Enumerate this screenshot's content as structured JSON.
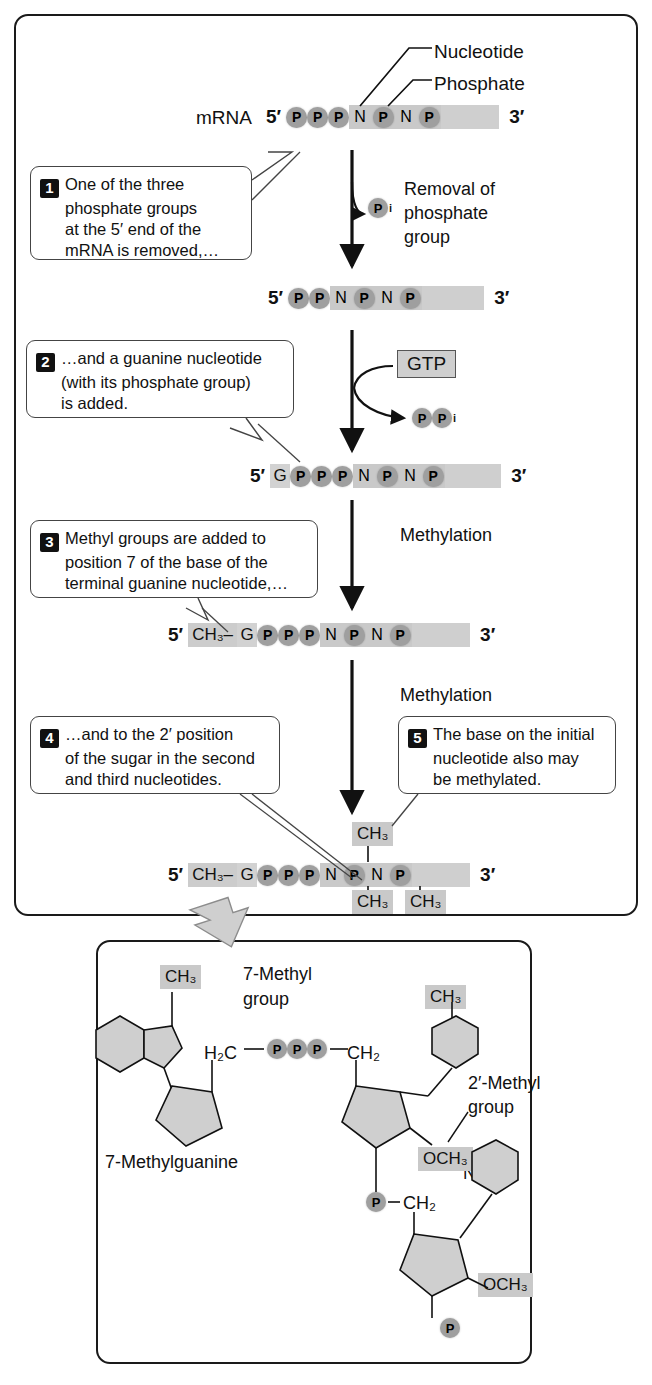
{
  "figure": {
    "labels": {
      "nucleotide": "Nucleotide",
      "phosphate": "Phosphate",
      "mrna": "mRNA",
      "five_prime": "5′",
      "three_prime": "3′"
    },
    "reactions": {
      "removal_line1": "Removal of",
      "removal_line2": "phosphate",
      "removal_line3": "group",
      "pi": "P",
      "pi_sub": "i",
      "gtp": "GTP",
      "ppi_p1": "P",
      "ppi_p2": "P",
      "ppi_sub": "i",
      "methylation_1": "Methylation",
      "methylation_2": "Methylation"
    },
    "steps": [
      {
        "number": "1",
        "lines": [
          "One of the three",
          "phosphate groups",
          "at the 5′ end of the",
          "mRNA is removed,…"
        ]
      },
      {
        "number": "2",
        "lines": [
          "…and a guanine nucleotide",
          "(with its phosphate group)",
          "is added."
        ]
      },
      {
        "number": "3",
        "lines": [
          "Methyl groups are added to",
          "position 7 of the base of the",
          "terminal guanine nucleotide,…"
        ]
      },
      {
        "number": "4",
        "lines": [
          "…and to the 2′ position",
          "of the sugar in the second",
          "and third nucleotides."
        ]
      },
      {
        "number": "5",
        "lines": [
          "The base on the initial",
          "nucleotide also may",
          "be methylated."
        ]
      }
    ],
    "strands": [
      {
        "name": "strand-initial",
        "prefix": "5′",
        "suffix": "3′",
        "units": [
          "P",
          "P",
          "P",
          "N",
          "P",
          "N",
          "P"
        ]
      },
      {
        "name": "strand-after-phosphate-removal",
        "prefix": "5′",
        "suffix": "3′",
        "units": [
          "P",
          "P",
          "N",
          "P",
          "N",
          "P"
        ]
      },
      {
        "name": "strand-after-guanine-added",
        "prefix": "5′",
        "suffix": "3′",
        "units": [
          "G",
          "P",
          "P",
          "P",
          "N",
          "P",
          "N",
          "P"
        ]
      },
      {
        "name": "strand-after-guanine-methylation",
        "prefix": "5′",
        "suffix": "3′",
        "cap": "CH₃–",
        "units": [
          "G",
          "P",
          "P",
          "P",
          "N",
          "P",
          "N",
          "P"
        ]
      },
      {
        "name": "strand-final-cap",
        "prefix": "5′",
        "suffix": "3′",
        "cap": "CH₃–",
        "units": [
          "G",
          "P",
          "P",
          "P",
          "N",
          "P",
          "N",
          "P"
        ],
        "methyl_top": "CH₃",
        "methyl_bottom_1": "CH₃",
        "methyl_bottom_2": "CH₃"
      }
    ],
    "structure": {
      "methyl_7": "CH₃",
      "methyl_7_label_line1": "7-Methyl",
      "methyl_7_label_line2": "group",
      "guanine_letter": "G",
      "guanine_name": "7-Methylguanine",
      "h2c": "H₂C",
      "phosphates": [
        "P",
        "P",
        "P"
      ],
      "ch2_right": "CH₂",
      "base_n_1": "N",
      "base_n_2": "N",
      "methyl_2prime": "CH₃",
      "methyl_2prime_label_line1": "2′-Methyl",
      "methyl_2prime_label_line2": "group",
      "och3_1": "OCH₃",
      "och3_2": "OCH₃",
      "phosphate_link_1": "P",
      "ch2_link": "CH₂",
      "phosphate_link_2": "P"
    },
    "colors": {
      "bead_gray": "#9f9f9f",
      "highlight_gray": "#c9c9c9",
      "strand_tail": "#cfcfcf",
      "outline": "#1a1a1a",
      "shape_fill": "#cccccc"
    }
  }
}
